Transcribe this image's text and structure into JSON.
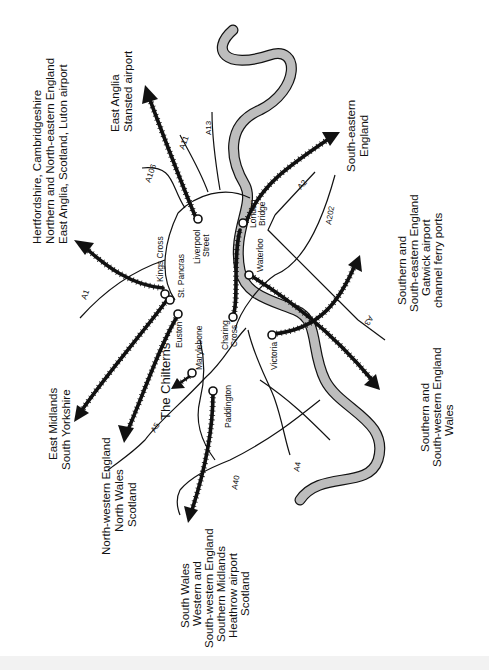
{
  "diagram": {
    "type": "rail-and-road-map",
    "colors": {
      "ink": "#111111",
      "river": "#bdbdbd",
      "background": "#ffffff"
    },
    "terminals": [
      {
        "id": "kings-cross",
        "label": "Kings Cross"
      },
      {
        "id": "st-pancras",
        "label": "St. Pancras"
      },
      {
        "id": "euston",
        "label": "Euston"
      },
      {
        "id": "marylebone",
        "label": "Marylebone"
      },
      {
        "id": "paddington",
        "label": "Paddington"
      },
      {
        "id": "liverpool-street",
        "label": "Liverpool Street",
        "lines": [
          "Liverpool",
          "Street"
        ]
      },
      {
        "id": "london-bridge",
        "label": "London Bridge",
        "lines": [
          "London",
          "Bridge"
        ]
      },
      {
        "id": "waterloo",
        "label": "Waterloo"
      },
      {
        "id": "charing-cross",
        "label": "Charing Cross",
        "lines": [
          "Charing",
          "Cross"
        ]
      },
      {
        "id": "victoria",
        "label": "Victoria"
      }
    ],
    "roads": [
      "A1",
      "A106",
      "A11",
      "A13",
      "A2",
      "A202",
      "A3",
      "A4",
      "A40",
      "A5"
    ],
    "destinations": {
      "kings_cross": [
        "Hertfordshire, Cambridgeshire",
        "Northern and North-eastern England",
        "East Anglia, Scotland, Luton airport"
      ],
      "liverpool_street": [
        "East Anglia",
        "Stansted airport"
      ],
      "london_bridge": [
        "South-eastern",
        "England"
      ],
      "charing_cross": [
        "Southern and",
        "South-eastern England",
        "Gatwick airport",
        "channel ferry ports"
      ],
      "waterloo": [
        "Southern and",
        "South-western England",
        "Wales"
      ],
      "st_pancras": [
        "East Midlands",
        "South Yorkshire"
      ],
      "euston": [
        "North-western England",
        "North Wales",
        "Scotland"
      ],
      "marylebone": "The Chilterns",
      "paddington": [
        "South Wales",
        "Western and",
        "South-western England",
        "Southern Midlands",
        "Heathrow airport",
        "Scotland"
      ]
    }
  }
}
